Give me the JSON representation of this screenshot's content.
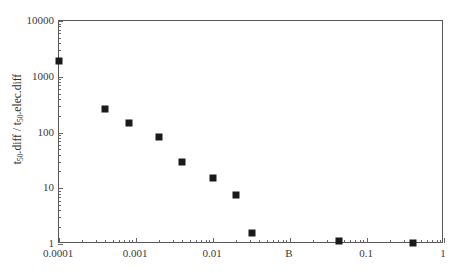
{
  "chart_data": {
    "type": "scatter",
    "title": "",
    "xlabel": "",
    "ylabel": "t50.diff / t50.elec.diff",
    "ylabel_parts": {
      "num_base": "t",
      "num_sub": "50",
      "num_rest": ".diff",
      "separator": " / ",
      "den_base": "t",
      "den_sub": "50",
      "den_rest": ".elec.diff"
    },
    "xscale": "log",
    "yscale": "log",
    "xlim": [
      0.0001,
      10
    ],
    "ylim": [
      1,
      10000
    ],
    "grid": false,
    "legend": null,
    "xticks": [
      {
        "value": 0.0001,
        "label": "0.0001"
      },
      {
        "value": 0.001,
        "label": "0.001"
      },
      {
        "value": 0.01,
        "label": "0.01"
      },
      {
        "value": 0.1,
        "label": "B"
      },
      {
        "value": 1,
        "label": "0.1"
      },
      {
        "value": 10,
        "label": "1"
      }
    ],
    "xtick_labels_rendered": [
      "0.0001",
      "0.001",
      "0.01",
      "B",
      "0.1",
      "1",
      "10"
    ],
    "yticks": [
      {
        "value": 1,
        "label": "1"
      },
      {
        "value": 10,
        "label": "10"
      },
      {
        "value": 100,
        "label": "100"
      },
      {
        "value": 1000,
        "label": "1000"
      },
      {
        "value": 10000,
        "label": "10000"
      }
    ],
    "marker": "square",
    "marker_color": "#1a1a1a",
    "points": [
      {
        "x": 0.0001,
        "y": 1900
      },
      {
        "x": 0.0004,
        "y": 260
      },
      {
        "x": 0.0008,
        "y": 148
      },
      {
        "x": 0.002,
        "y": 83
      },
      {
        "x": 0.004,
        "y": 30
      },
      {
        "x": 0.01,
        "y": 15.5
      },
      {
        "x": 0.02,
        "y": 7.6
      },
      {
        "x": 0.032,
        "y": 1.6
      },
      {
        "x": 0.43,
        "y": 1.15
      },
      {
        "x": 4.0,
        "y": 1.05
      }
    ]
  },
  "axes": {
    "x_tick_labels": [
      "0.0001",
      "0.001",
      "0.01",
      "B",
      "0.1",
      "1",
      "10"
    ],
    "y_tick_labels": [
      "10000",
      "1000",
      "100",
      "10",
      "1"
    ]
  }
}
